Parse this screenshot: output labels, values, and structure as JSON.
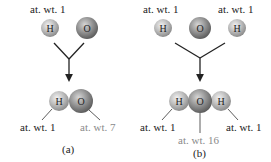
{
  "panels": {
    "a": {
      "caption": "(a)",
      "reactants": [
        {
          "symbol": "H",
          "label": "at. wt. 1"
        },
        {
          "symbol": "O",
          "label": ""
        }
      ],
      "product": {
        "atoms": [
          {
            "symbol": "H",
            "label": "at. wt. 1"
          },
          {
            "symbol": "O",
            "label": "at. wt. 7"
          }
        ]
      }
    },
    "b": {
      "caption": "(b)",
      "reactants": [
        {
          "symbol": "H",
          "label": "at. wt. 1"
        },
        {
          "symbol": "O",
          "label": ""
        },
        {
          "symbol": "H",
          "label": "at. wt. 1"
        }
      ],
      "product": {
        "atoms": [
          {
            "symbol": "H",
            "label": "at. wt. 1"
          },
          {
            "symbol": "O",
            "label": "at. wt. 16"
          },
          {
            "symbol": "H",
            "label": "at. wt. 1"
          }
        ]
      }
    }
  },
  "colors": {
    "hydrogen": "#b9b9b9",
    "oxygen": "#8f8f8f",
    "line": "#222222",
    "highlight_label": "#8a8a8a"
  }
}
